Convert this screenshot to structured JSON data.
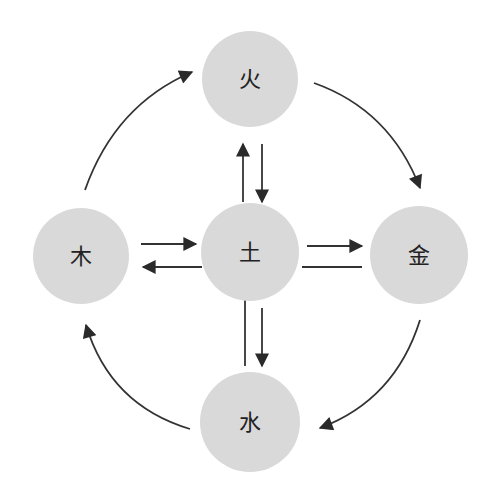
{
  "diagram": {
    "type": "five-elements-cycle",
    "colors": {
      "node_fill": "#d9d9d9",
      "edge": "#333333",
      "label": "#222222",
      "background": "#ffffff"
    },
    "nodes": {
      "fire": {
        "label": "火",
        "position": "top"
      },
      "wood": {
        "label": "木",
        "position": "left"
      },
      "earth": {
        "label": "土",
        "position": "center"
      },
      "metal": {
        "label": "金",
        "position": "right"
      },
      "water": {
        "label": "水",
        "position": "bottom"
      }
    },
    "edges": [
      {
        "from": "wood",
        "to": "fire",
        "style": "curved"
      },
      {
        "from": "fire",
        "to": "metal",
        "style": "curved"
      },
      {
        "from": "metal",
        "to": "water",
        "style": "curved"
      },
      {
        "from": "water",
        "to": "wood",
        "style": "curved"
      },
      {
        "from": "earth",
        "to": "fire",
        "style": "straight"
      },
      {
        "from": "fire",
        "to": "earth",
        "style": "straight"
      },
      {
        "from": "wood",
        "to": "earth",
        "style": "straight"
      },
      {
        "from": "earth",
        "to": "wood",
        "style": "straight"
      },
      {
        "from": "earth",
        "to": "metal",
        "style": "straight"
      },
      {
        "from": "metal",
        "to": "earth",
        "style": "straight-line-no-arrowhead"
      },
      {
        "from": "earth",
        "to": "water",
        "style": "straight"
      },
      {
        "from": "water",
        "to": "earth",
        "style": "straight-line-no-arrowhead"
      }
    ]
  }
}
